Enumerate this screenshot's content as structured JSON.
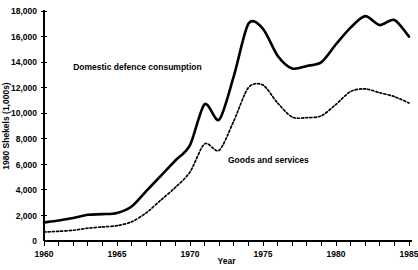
{
  "chart_data": {
    "type": "line",
    "title": "",
    "xlabel": "Year",
    "ylabel": "1980 Shekels (1,000s)",
    "xlim": [
      1960,
      1985
    ],
    "ylim": [
      0,
      18000
    ],
    "grid": false,
    "legend_position": "inline-annotations",
    "x_tick_labels": [
      "1960",
      "1965",
      "1970",
      "1975",
      "1980",
      "1985"
    ],
    "x_tick_values": [
      1960,
      1965,
      1970,
      1975,
      1980,
      1985
    ],
    "x_minor_tick_interval": 1,
    "y_tick_labels": [
      "0",
      "2,000",
      "4,000",
      "6,000",
      "8,000",
      "10,000",
      "12,000",
      "14,000",
      "16,000",
      "18,000"
    ],
    "y_tick_values": [
      0,
      2000,
      4000,
      6000,
      8000,
      10000,
      12000,
      14000,
      16000,
      18000
    ],
    "x": [
      1960,
      1961,
      1962,
      1963,
      1964,
      1965,
      1966,
      1967,
      1968,
      1969,
      1970,
      1971,
      1972,
      1973,
      1974,
      1975,
      1976,
      1977,
      1978,
      1979,
      1980,
      1981,
      1982,
      1983,
      1984,
      1985
    ],
    "series": [
      {
        "name": "Domestic defence consumption",
        "style": "solid",
        "label_x": 1962.0,
        "label_y": 13400,
        "values": [
          1450,
          1600,
          1800,
          2050,
          2100,
          2200,
          2700,
          3900,
          5100,
          6300,
          7500,
          10700,
          9500,
          12900,
          17000,
          16600,
          14500,
          13500,
          13700,
          14000,
          15400,
          16700,
          17600,
          16900,
          17300,
          16000
        ]
      },
      {
        "name": "Goods and services",
        "style": "dotted",
        "label_x": 1972.6,
        "label_y": 6100,
        "values": [
          700,
          760,
          840,
          1000,
          1100,
          1200,
          1500,
          2200,
          3200,
          4200,
          5400,
          7600,
          7100,
          9400,
          12000,
          12200,
          10800,
          9700,
          9650,
          9800,
          10700,
          11700,
          11900,
          11600,
          11300,
          10800
        ]
      }
    ],
    "annotations": [
      {
        "text": "Domestic defence consumption",
        "x": 1962.0,
        "y": 13400
      },
      {
        "text": "Goods and services",
        "x": 1972.6,
        "y": 6100
      }
    ]
  }
}
